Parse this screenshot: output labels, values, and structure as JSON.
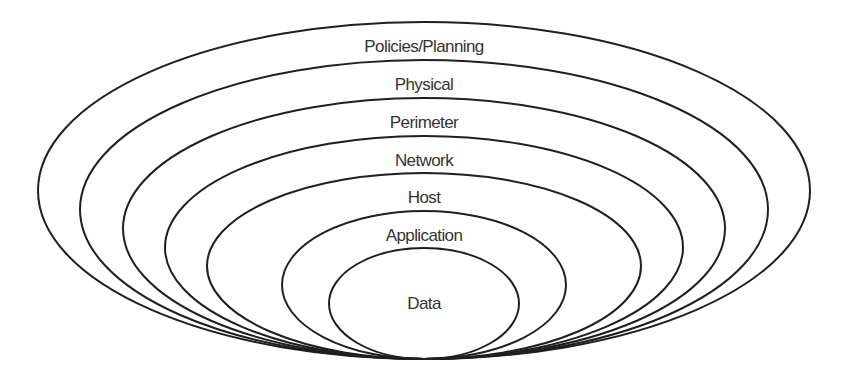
{
  "diagram": {
    "type": "nested-ellipses",
    "description_visible": "Defense-in-depth layers",
    "stroke_color": "#1f1f1f",
    "label_color": "#333333",
    "layers": [
      {
        "label": "Policies/Planning",
        "cx": 424,
        "cy": 190.5,
        "rx": 386,
        "ry": 168.5,
        "label_y": 52
      },
      {
        "label": "Physical",
        "cx": 424,
        "cy": 209.5,
        "rx": 344,
        "ry": 149.5,
        "label_y": 90
      },
      {
        "label": "Perimeter",
        "cx": 424,
        "cy": 228.5,
        "rx": 301,
        "ry": 130.5,
        "label_y": 128
      },
      {
        "label": "Network",
        "cx": 424,
        "cy": 247.5,
        "rx": 259,
        "ry": 111.5,
        "label_y": 166
      },
      {
        "label": "Host",
        "cx": 424,
        "cy": 266,
        "rx": 217,
        "ry": 93,
        "label_y": 203
      },
      {
        "label": "Application",
        "cx": 424,
        "cy": 285,
        "rx": 142,
        "ry": 74,
        "label_y": 241
      },
      {
        "label": "Data",
        "cx": 424,
        "cy": 303.5,
        "rx": 95,
        "ry": 55.5,
        "label_y": 309
      }
    ]
  }
}
